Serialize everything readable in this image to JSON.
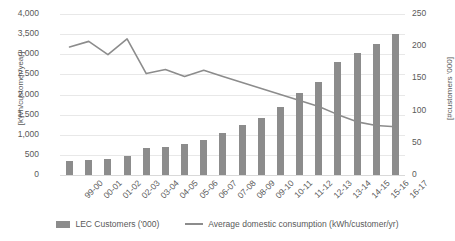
{
  "chart_data": {
    "type": "bar",
    "title": "",
    "subtitle": "",
    "xlabel": "",
    "ylabel": "[kWh/customer/year]",
    "y2label": "[#customers '000]",
    "grid": true,
    "legend_position": "bottom",
    "categories": [
      "99-00",
      "00-01",
      "01-02",
      "02-03",
      "03-04",
      "04-05",
      "05-06",
      "06-07",
      "07-08",
      "08-09",
      "09-10",
      "10-11",
      "11-12",
      "12-13",
      "13-14",
      "14-15",
      "15-16",
      "16-17"
    ],
    "ylim": [
      0,
      4000
    ],
    "y2lim": [
      0,
      250
    ],
    "yticks": [
      "0",
      "500",
      "1,000",
      "1,500",
      "2,000",
      "2,500",
      "3,000",
      "3,500",
      "4,000"
    ],
    "y2ticks": [
      "0",
      "50",
      "100",
      "150",
      "200",
      "250"
    ],
    "series": [
      {
        "name": "LEC Customers ('000)",
        "type": "bar",
        "axis": "right",
        "color": "#8c8c8c",
        "values": [
          22,
          23,
          25,
          29,
          42,
          43,
          48,
          55,
          66,
          77,
          89,
          105,
          128,
          144,
          175,
          190,
          203,
          219
        ]
      },
      {
        "name": "Average domestic consumption (kWh/customer/yr)",
        "type": "line",
        "axis": "left",
        "color": "#8c8c8c",
        "values": [
          3180,
          3320,
          2990,
          3380,
          2520,
          2620,
          2450,
          2600,
          2450,
          2300,
          2150,
          2000,
          1850,
          1700,
          1500,
          1320,
          1230,
          1200
        ]
      }
    ]
  },
  "legend": {
    "items": [
      {
        "label": "LEC Customers ('000)",
        "marker": "bar-swatch-icon"
      },
      {
        "label": "Average domestic consumption (kWh/customer/yr)",
        "marker": "line-swatch-icon"
      }
    ]
  },
  "colors": {
    "series": "#8c8c8c",
    "grid": "#e8e8e8",
    "text": "#595959",
    "background": "#ffffff"
  }
}
